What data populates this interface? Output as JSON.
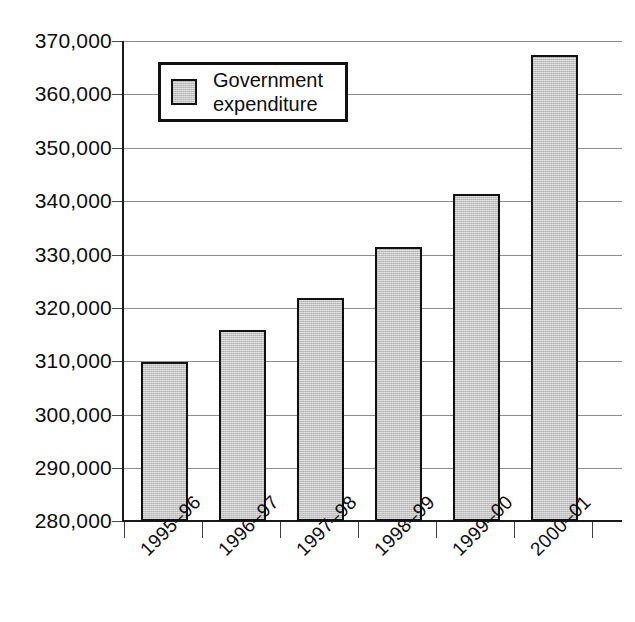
{
  "chart_data": {
    "type": "bar",
    "title": "",
    "xlabel": "",
    "ylabel": "",
    "categories": [
      "1995–96",
      "1996–97",
      "1997–98",
      "1998–99",
      "1999–00",
      "2000–01"
    ],
    "values": [
      309800,
      315800,
      321900,
      331400,
      341300,
      367400
    ],
    "series": [
      {
        "name": "Government expenditure",
        "values": [
          309800,
          315800,
          321900,
          331400,
          341300,
          367400
        ]
      }
    ],
    "ylim": [
      280000,
      370000
    ],
    "ytick_step": 10000,
    "ytick_labels": [
      "370,000",
      "360,000",
      "350,000",
      "340,000",
      "330,000",
      "320,000",
      "310,000",
      "300,000",
      "290,000",
      "280,000"
    ],
    "ytick_values": [
      370000,
      360000,
      350000,
      340000,
      330000,
      320000,
      310000,
      300000,
      290000,
      280000
    ],
    "grid": true,
    "legend_position": "upper-left-inside",
    "bar_fill_color": "#c2c2c2",
    "bar_border_color": "#111111",
    "gridline_color": "#8d8d8d",
    "axis_color": "#1a1a1a",
    "xlabel_rotation_deg": -45
  },
  "legend": {
    "entries": [
      {
        "label_line1": "Government",
        "label_line2": "expenditure",
        "swatch_color": "#c2c2c2"
      }
    ]
  }
}
